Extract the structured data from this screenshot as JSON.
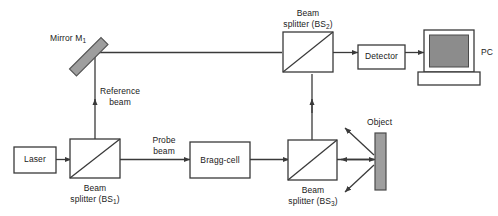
{
  "figure": {
    "type": "optical-schematic",
    "background": "#ffffff",
    "line_color": "#3a3a3a",
    "mirror_fill": "#9e9e9e",
    "object_fill": "#9e9e9e",
    "screen_fill": "#8c8c8c",
    "text_color": "#1a1a1a"
  },
  "components": {
    "laser": {
      "label": "Laser",
      "x": 14,
      "y": 147,
      "w": 42,
      "h": 26
    },
    "bragg_cell": {
      "label": "Bragg-cell",
      "x": 190,
      "y": 142,
      "w": 60,
      "h": 36
    },
    "detector": {
      "label": "Detector",
      "x": 358,
      "y": 45,
      "w": 47,
      "h": 24
    },
    "pc": {
      "label": "PC",
      "x": 418,
      "y": 30,
      "w": 62,
      "h": 55
    },
    "mirror": {
      "label": "Mirror M",
      "subscript": "1",
      "angle_deg": 45
    },
    "object": {
      "label": "Object",
      "x": 375,
      "y": 133,
      "w": 11,
      "h": 57
    },
    "beam_splitter_1": {
      "label_line1": "Beam",
      "label_line2": "splitter (BS",
      "subscript": "1",
      "label_close": ")",
      "x": 70,
      "y": 139,
      "w": 50,
      "h": 39
    },
    "beam_splitter_2": {
      "label_line1": "Beam",
      "label_line2": "splitter (BS",
      "subscript": "2",
      "label_close": ")",
      "x": 283,
      "y": 32,
      "w": 50,
      "h": 40
    },
    "beam_splitter_3": {
      "label_line1": "Beam",
      "label_line2": "splitter (BS",
      "subscript": "3",
      "label_close": ")",
      "x": 288,
      "y": 140,
      "w": 49,
      "h": 40
    }
  },
  "beams": {
    "reference": {
      "label_line1": "Reference",
      "label_line2": "beam"
    },
    "probe": {
      "label_line1": "Probe",
      "label_line2": "beam"
    }
  }
}
